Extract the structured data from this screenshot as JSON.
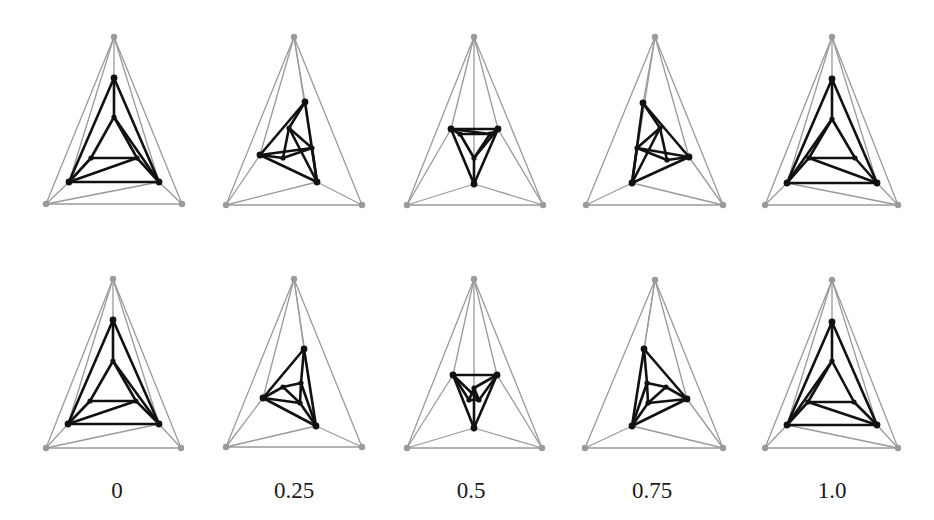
{
  "figure": {
    "outer_color": "#9a9a9a",
    "inner_color": "#111111",
    "labels": [
      {
        "text": "0",
        "x": 117
      },
      {
        "text": "0.25",
        "x": 294
      },
      {
        "text": "0.5",
        "x": 471
      },
      {
        "text": "0.75",
        "x": 652
      },
      {
        "text": "1.0",
        "x": 832
      }
    ],
    "rows": [
      {
        "name": "top-row",
        "frames": [
          {
            "t": "0",
            "outer": [
              [
                114,
                37
              ],
              [
                46,
                204
              ],
              [
                182,
                204
              ]
            ],
            "inner": [
              [
                114,
                78
              ],
              [
                69,
                182
              ],
              [
                159,
                182
              ]
            ],
            "innermost": [
              [
                114,
                117
              ],
              [
                91,
                158
              ],
              [
                137,
                158
              ]
            ],
            "cross_gray": [
              [
                1,
                "R"
              ]
            ],
            "cross_black": [
              [
                "R",
                "iT"
              ],
              [
                "L",
                "iR"
              ]
            ]
          },
          {
            "t": "0.25",
            "outer": [
              [
                294,
                37
              ],
              [
                226,
                205
              ],
              [
                362,
                205
              ]
            ],
            "inner": [
              [
                305,
                102
              ],
              [
                260,
                155
              ],
              [
                317,
                182
              ]
            ],
            "innermost": [
              [
                289,
                128
              ],
              [
                283,
                158
              ],
              [
                312,
                148
              ]
            ],
            "cross_gray": [
              [
                1,
                "R"
              ]
            ],
            "cross_black": [
              [
                "R",
                "iT"
              ],
              [
                "L",
                "iR"
              ]
            ]
          },
          {
            "t": "0.5",
            "outer": [
              [
                474,
                37
              ],
              [
                407,
                205
              ],
              [
                543,
                205
              ]
            ],
            "inner": [
              [
                474,
                184
              ],
              [
                451,
                129
              ],
              [
                498,
                129
              ]
            ],
            "innermost": [
              [
                474,
                158
              ],
              [
                460,
                134
              ],
              [
                490,
                134
              ]
            ],
            "cross_gray": [
              [
                1,
                "T"
              ],
              [
                2,
                "T"
              ]
            ],
            "cross_black": [
              [
                "R",
                "iT"
              ],
              [
                "L",
                "iR"
              ]
            ]
          },
          {
            "t": "0.75",
            "outer": [
              [
                655,
                37
              ],
              [
                586,
                205
              ],
              [
                723,
                205
              ]
            ],
            "inner": [
              [
                643,
                103
              ],
              [
                632,
                183
              ],
              [
                689,
                157
              ]
            ],
            "innermost": [
              [
                660,
                128
              ],
              [
                637,
                148
              ],
              [
                667,
                160
              ]
            ],
            "cross_gray": [
              [
                2,
                "L"
              ]
            ],
            "cross_black": [
              [
                "L",
                "iT"
              ],
              [
                "R",
                "iL"
              ]
            ]
          },
          {
            "t": "1.0",
            "outer": [
              [
                832,
                37
              ],
              [
                765,
                205
              ],
              [
                898,
                205
              ]
            ],
            "inner": [
              [
                832,
                79
              ],
              [
                787,
                183
              ],
              [
                877,
                183
              ]
            ],
            "innermost": [
              [
                832,
                119
              ],
              [
                809,
                158
              ],
              [
                855,
                158
              ]
            ],
            "cross_gray": [
              [
                2,
                "L"
              ]
            ],
            "cross_black": [
              [
                "L",
                "iT"
              ],
              [
                "R",
                "iL"
              ]
            ]
          }
        ]
      },
      {
        "name": "bottom-row",
        "frames": [
          {
            "t": "0",
            "outer": [
              [
                113,
                279
              ],
              [
                46,
                448
              ],
              [
                181,
                448
              ]
            ],
            "inner": [
              [
                113,
                320
              ],
              [
                68,
                424
              ],
              [
                159,
                424
              ]
            ],
            "innermost": [
              [
                113,
                361
              ],
              [
                90,
                401
              ],
              [
                136,
                401
              ]
            ],
            "cross_gray": [
              [
                1,
                "R"
              ]
            ],
            "cross_black": [
              [
                "R",
                "iT"
              ],
              [
                "L",
                "iR"
              ]
            ]
          },
          {
            "t": "0.25",
            "outer": [
              [
                294,
                279
              ],
              [
                226,
                447
              ],
              [
                362,
                447
              ]
            ],
            "inner": [
              [
                304,
                349
              ],
              [
                263,
                398
              ],
              [
                316,
                426
              ]
            ],
            "innermost": [
              [
                301,
                383
              ],
              [
                283,
                387
              ],
              [
                300,
                403
              ]
            ],
            "cross_gray": [
              [
                1,
                "R"
              ]
            ],
            "cross_black": [
              [
                "R",
                "iT"
              ],
              [
                "L",
                "iR"
              ]
            ]
          },
          {
            "t": "0.5",
            "outer": [
              [
                474,
                279
              ],
              [
                407,
                448
              ],
              [
                542,
                448
              ]
            ],
            "inner": [
              [
                474,
                428
              ],
              [
                453,
                375
              ],
              [
                497,
                375
              ]
            ],
            "innermost": [
              [
                474,
                388
              ],
              [
                469,
                400
              ],
              [
                479,
                400
              ]
            ],
            "cross_gray": [
              [
                1,
                "T"
              ],
              [
                2,
                "T"
              ]
            ],
            "cross_black": [
              [
                "R",
                "iT"
              ],
              [
                "L",
                "iR"
              ]
            ]
          },
          {
            "t": "0.75",
            "outer": [
              [
                655,
                280
              ],
              [
                585,
                448
              ],
              [
                723,
                448
              ]
            ],
            "inner": [
              [
                644,
                349
              ],
              [
                632,
                426
              ],
              [
                687,
                399
              ]
            ],
            "innermost": [
              [
                647,
                383
              ],
              [
                648,
                403
              ],
              [
                666,
                387
              ]
            ],
            "cross_gray": [
              [
                2,
                "L"
              ]
            ],
            "cross_black": [
              [
                "L",
                "iT"
              ],
              [
                "R",
                "iL"
              ]
            ]
          },
          {
            "t": "1.0",
            "outer": [
              [
                832,
                280
              ],
              [
                765,
                448
              ],
              [
                898,
                448
              ]
            ],
            "inner": [
              [
                832,
                322
              ],
              [
                787,
                425
              ],
              [
                877,
                425
              ]
            ],
            "innermost": [
              [
                832,
                361
              ],
              [
                808,
                402
              ],
              [
                854,
                402
              ]
            ],
            "cross_gray": [
              [
                2,
                "L"
              ]
            ],
            "cross_black": [
              [
                "L",
                "iT"
              ],
              [
                "R",
                "iL"
              ]
            ]
          }
        ]
      }
    ]
  }
}
